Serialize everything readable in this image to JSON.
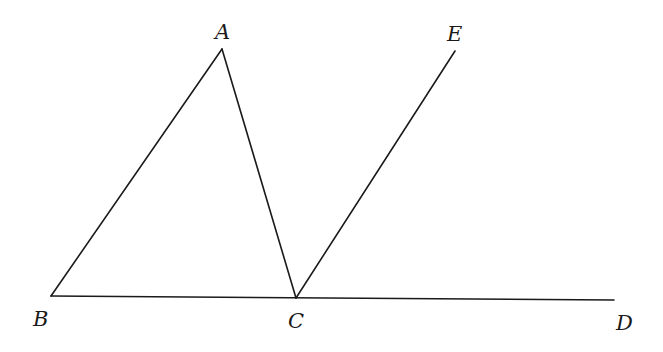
{
  "diagram": {
    "type": "geometry",
    "points": {
      "A": {
        "label": "A",
        "x": 222,
        "y": 49
      },
      "B": {
        "label": "B",
        "x": 51,
        "y": 296
      },
      "C": {
        "label": "C",
        "x": 296,
        "y": 298
      },
      "D": {
        "label": "D",
        "x": 614,
        "y": 300
      },
      "E": {
        "label": "E",
        "x": 455,
        "y": 51
      }
    },
    "segments": [
      {
        "from": "A",
        "to": "B"
      },
      {
        "from": "A",
        "to": "C"
      },
      {
        "from": "B",
        "to": "D"
      },
      {
        "from": "C",
        "to": "E"
      }
    ],
    "labels": {
      "A": "A",
      "B": "B",
      "C": "C",
      "D": "D",
      "E": "E"
    },
    "stroke_color": "#1a1a1a",
    "background": "#ffffff"
  }
}
